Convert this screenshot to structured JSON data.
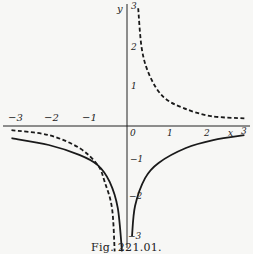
{
  "caption": "Fig. 221.01.",
  "chart_data": {
    "type": "line",
    "title": "",
    "xlabel": "x",
    "ylabel": "y",
    "xlim": [
      -3,
      3
    ],
    "ylim": [
      -3,
      3
    ],
    "grid": false,
    "x_ticks": [
      "-3",
      "-2",
      "-1",
      "0",
      "1",
      "2",
      "3"
    ],
    "y_ticks": [
      "3",
      "2",
      "1",
      "-1",
      "-2",
      "-3"
    ],
    "series": [
      {
        "name": "dashed-upper-right",
        "style": "dashed",
        "points": [
          [
            0.29,
            3.1
          ],
          [
            0.39,
            2.0
          ],
          [
            0.6,
            1.3
          ],
          [
            0.95,
            0.76
          ],
          [
            1.47,
            0.47
          ],
          [
            2.18,
            0.26
          ],
          [
            3.05,
            0.2
          ]
        ]
      },
      {
        "name": "dashed-lower-left",
        "style": "dashed",
        "points": [
          [
            -3.0,
            -0.11
          ],
          [
            -2.03,
            -0.24
          ],
          [
            -1.24,
            -0.58
          ],
          [
            -0.76,
            -1.03
          ],
          [
            -0.58,
            -1.47
          ],
          [
            -0.39,
            -2.16
          ],
          [
            -0.32,
            -3.3
          ]
        ]
      },
      {
        "name": "solid-lower-left",
        "style": "solid",
        "points": [
          [
            -3.0,
            -0.32
          ],
          [
            -2.03,
            -0.5
          ],
          [
            -1.24,
            -0.76
          ],
          [
            -0.76,
            -1.03
          ],
          [
            -0.45,
            -1.47
          ],
          [
            -0.24,
            -2.16
          ],
          [
            -0.13,
            -3.3
          ]
        ]
      },
      {
        "name": "solid-lower-right",
        "style": "solid",
        "points": [
          [
            0.13,
            -2.9
          ],
          [
            0.21,
            -2.1
          ],
          [
            0.47,
            -1.37
          ],
          [
            0.82,
            -0.97
          ],
          [
            1.53,
            -0.58
          ],
          [
            2.24,
            -0.37
          ],
          [
            3.05,
            -0.24
          ]
        ]
      }
    ]
  },
  "labels": {
    "x_axis_name": "x",
    "y_axis_name": "y",
    "xm3": "−3",
    "xm2": "−2",
    "xm1": "−1",
    "x0": "0",
    "x1": "1",
    "x2": "2",
    "x3": "3",
    "y3": "3",
    "y2": "2",
    "y1": "1",
    "ym1": "−1",
    "ym2": "−2",
    "ym3": "−3"
  }
}
